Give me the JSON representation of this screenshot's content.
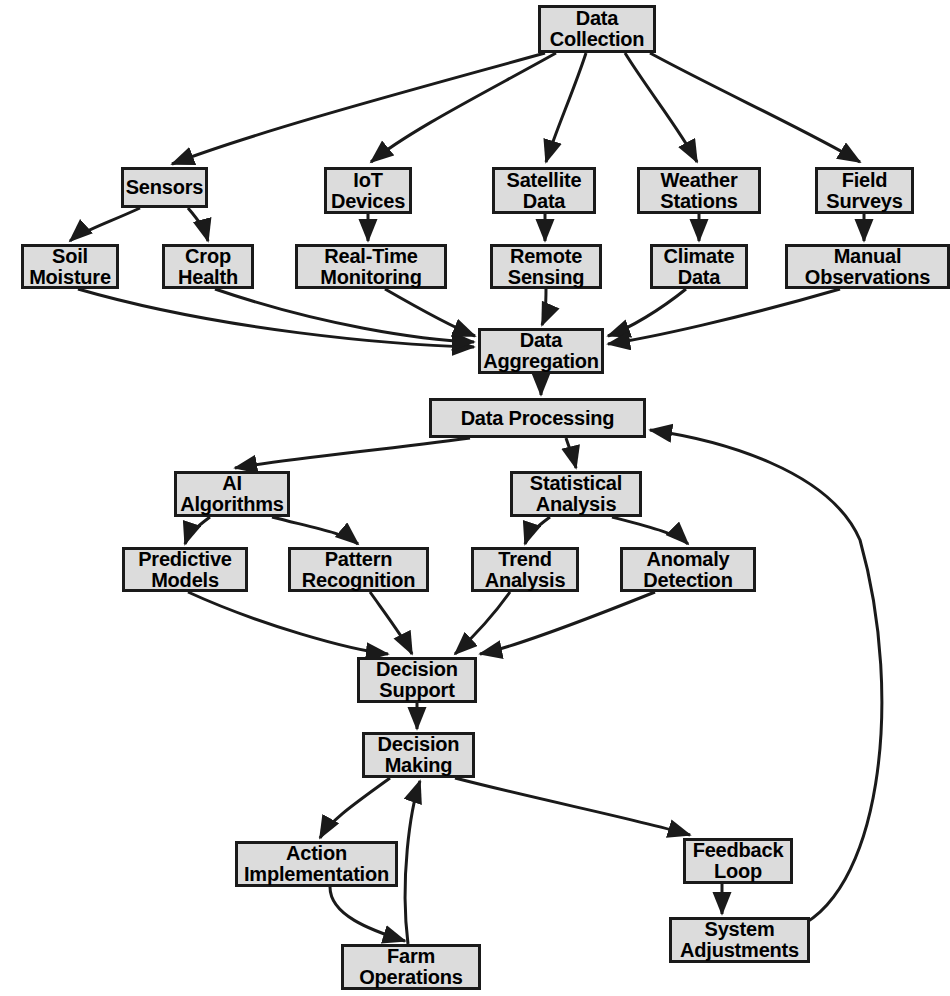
{
  "diagram": {
    "type": "flowchart",
    "background_color": "#ffffff",
    "node_fill_color": "#dcdcdc",
    "node_border_color": "#1a1a1a",
    "edge_color": "#1a1a1a",
    "text_color": "#000000",
    "nodes": [
      {
        "id": "data_collection",
        "label": "Data\nCollection",
        "x": 538,
        "y": 5,
        "w": 118,
        "h": 48
      },
      {
        "id": "sensors",
        "label": "Sensors",
        "x": 121,
        "y": 167,
        "w": 87,
        "h": 41
      },
      {
        "id": "iot_devices",
        "label": "IoT\nDevices",
        "x": 324,
        "y": 167,
        "w": 88,
        "h": 47
      },
      {
        "id": "satellite_data",
        "label": "Satellite\nData",
        "x": 492,
        "y": 167,
        "w": 104,
        "h": 47
      },
      {
        "id": "weather_stations",
        "label": "Weather\nStations",
        "x": 637,
        "y": 167,
        "w": 124,
        "h": 47
      },
      {
        "id": "field_surveys",
        "label": "Field\nSurveys",
        "x": 815,
        "y": 167,
        "w": 99,
        "h": 47
      },
      {
        "id": "soil_moisture",
        "label": "Soil\nMoisture",
        "x": 21,
        "y": 244,
        "w": 98,
        "h": 45
      },
      {
        "id": "crop_health",
        "label": "Crop\nHealth",
        "x": 162,
        "y": 244,
        "w": 92,
        "h": 45
      },
      {
        "id": "real_time_monitoring",
        "label": "Real-Time\nMonitoring",
        "x": 295,
        "y": 244,
        "w": 152,
        "h": 45
      },
      {
        "id": "remote_sensing",
        "label": "Remote\nSensing",
        "x": 490,
        "y": 244,
        "w": 112,
        "h": 45
      },
      {
        "id": "climate_data",
        "label": "Climate\nData",
        "x": 650,
        "y": 244,
        "w": 98,
        "h": 45
      },
      {
        "id": "manual_observations",
        "label": "Manual\nObservations",
        "x": 785,
        "y": 244,
        "w": 165,
        "h": 45
      },
      {
        "id": "data_aggregation",
        "label": "Data\nAggregation",
        "x": 478,
        "y": 328,
        "w": 126,
        "h": 46
      },
      {
        "id": "data_processing",
        "label": "Data Processing",
        "x": 429,
        "y": 398,
        "w": 217,
        "h": 40
      },
      {
        "id": "ai_algorithms",
        "label": "AI\nAlgorithms",
        "x": 174,
        "y": 471,
        "w": 116,
        "h": 46
      },
      {
        "id": "statistical_analysis",
        "label": "Statistical\nAnalysis",
        "x": 510,
        "y": 471,
        "w": 132,
        "h": 46
      },
      {
        "id": "predictive_models",
        "label": "Predictive\nModels",
        "x": 122,
        "y": 547,
        "w": 126,
        "h": 45
      },
      {
        "id": "pattern_recognition",
        "label": "Pattern\nRecognition",
        "x": 288,
        "y": 547,
        "w": 141,
        "h": 45
      },
      {
        "id": "trend_analysis",
        "label": "Trend\nAnalysis",
        "x": 471,
        "y": 547,
        "w": 108,
        "h": 45
      },
      {
        "id": "anomaly_detection",
        "label": "Anomaly\nDetection",
        "x": 620,
        "y": 547,
        "w": 136,
        "h": 45
      },
      {
        "id": "decision_support",
        "label": "Decision\nSupport",
        "x": 357,
        "y": 657,
        "w": 120,
        "h": 46
      },
      {
        "id": "decision_making",
        "label": "Decision\nMaking",
        "x": 362,
        "y": 732,
        "w": 113,
        "h": 46
      },
      {
        "id": "action_implementation",
        "label": "Action\nImplementation",
        "x": 235,
        "y": 841,
        "w": 163,
        "h": 46
      },
      {
        "id": "farm_operations",
        "label": "Farm\nOperations",
        "x": 341,
        "y": 944,
        "w": 140,
        "h": 46
      },
      {
        "id": "feedback_loop",
        "label": "Feedback\nLoop",
        "x": 683,
        "y": 838,
        "w": 110,
        "h": 46
      },
      {
        "id": "system_adjustments",
        "label": "System\nAdjustments",
        "x": 669,
        "y": 917,
        "w": 141,
        "h": 46
      }
    ],
    "edges": [
      {
        "from": "data_collection",
        "to": "sensors"
      },
      {
        "from": "data_collection",
        "to": "iot_devices"
      },
      {
        "from": "data_collection",
        "to": "satellite_data"
      },
      {
        "from": "data_collection",
        "to": "weather_stations"
      },
      {
        "from": "data_collection",
        "to": "field_surveys"
      },
      {
        "from": "sensors",
        "to": "soil_moisture"
      },
      {
        "from": "sensors",
        "to": "crop_health"
      },
      {
        "from": "iot_devices",
        "to": "real_time_monitoring"
      },
      {
        "from": "satellite_data",
        "to": "remote_sensing"
      },
      {
        "from": "weather_stations",
        "to": "climate_data"
      },
      {
        "from": "field_surveys",
        "to": "manual_observations"
      },
      {
        "from": "soil_moisture",
        "to": "data_aggregation"
      },
      {
        "from": "crop_health",
        "to": "data_aggregation"
      },
      {
        "from": "real_time_monitoring",
        "to": "data_aggregation"
      },
      {
        "from": "remote_sensing",
        "to": "data_aggregation"
      },
      {
        "from": "climate_data",
        "to": "data_aggregation"
      },
      {
        "from": "manual_observations",
        "to": "data_aggregation"
      },
      {
        "from": "data_aggregation",
        "to": "data_processing"
      },
      {
        "from": "data_processing",
        "to": "ai_algorithms"
      },
      {
        "from": "data_processing",
        "to": "statistical_analysis"
      },
      {
        "from": "ai_algorithms",
        "to": "predictive_models"
      },
      {
        "from": "ai_algorithms",
        "to": "pattern_recognition"
      },
      {
        "from": "statistical_analysis",
        "to": "trend_analysis"
      },
      {
        "from": "statistical_analysis",
        "to": "anomaly_detection"
      },
      {
        "from": "predictive_models",
        "to": "decision_support"
      },
      {
        "from": "pattern_recognition",
        "to": "decision_support"
      },
      {
        "from": "trend_analysis",
        "to": "decision_support"
      },
      {
        "from": "anomaly_detection",
        "to": "decision_support"
      },
      {
        "from": "decision_support",
        "to": "decision_making"
      },
      {
        "from": "decision_making",
        "to": "action_implementation"
      },
      {
        "from": "action_implementation",
        "to": "farm_operations"
      },
      {
        "from": "decision_making",
        "to": "feedback_loop"
      },
      {
        "from": "feedback_loop",
        "to": "system_adjustments"
      },
      {
        "from": "system_adjustments",
        "to": "data_processing"
      },
      {
        "from": "farm_operations",
        "to": "decision_making"
      }
    ],
    "edge_paths": [
      {
        "id": "e-dc-sensors",
        "d": "M 545,53 C 430,85 260,130 172,164"
      },
      {
        "id": "e-dc-iot",
        "d": "M 556,53 C 490,90 410,130 371,162"
      },
      {
        "id": "e-dc-sat",
        "d": "M 586,53 C 574,90 556,130 546,162"
      },
      {
        "id": "e-dc-weather",
        "d": "M 625,53 C 648,90 680,130 697,162"
      },
      {
        "id": "e-dc-field",
        "d": "M 650,53 C 718,90 810,132 860,162"
      },
      {
        "id": "e-sen-soil",
        "d": "M 140,208 C 110,222 80,232 70,241"
      },
      {
        "id": "e-sen-crop",
        "d": "M 188,208 C 200,222 205,230 208,241"
      },
      {
        "id": "e-iot-rtm",
        "d": "M 368,214 L 368,241"
      },
      {
        "id": "e-sat-rs",
        "d": "M 545,214 L 545,241"
      },
      {
        "id": "e-ws-cd",
        "d": "M 699,214 L 699,241"
      },
      {
        "id": "e-fs-mo",
        "d": "M 864,214 L 864,241"
      },
      {
        "id": "e-soil-da",
        "d": "M 78,289 C 220,330 390,345 474,347"
      },
      {
        "id": "e-crop-da",
        "d": "M 215,289 C 320,325 420,340 474,342"
      },
      {
        "id": "e-rtm-da",
        "d": "M 385,289 C 430,315 460,330 475,336"
      },
      {
        "id": "e-rs-da",
        "d": "M 546,289 C 546,305 545,318 542,325"
      },
      {
        "id": "e-cd-da",
        "d": "M 686,289 C 660,310 630,328 608,336"
      },
      {
        "id": "e-mo-da",
        "d": "M 840,289 C 740,318 650,338 608,344"
      },
      {
        "id": "e-da-dp",
        "d": "M 541,374 L 541,395"
      },
      {
        "id": "e-dp-ai",
        "d": "M 470,438 C 380,450 280,460 235,468"
      },
      {
        "id": "e-dp-sa",
        "d": "M 566,438 C 570,450 574,460 576,468"
      },
      {
        "id": "e-ai-pm",
        "d": "M 210,517 C 195,528 188,535 185,544"
      },
      {
        "id": "e-ai-pr",
        "d": "M 272,517 C 310,527 345,533 358,544"
      },
      {
        "id": "e-sa-ta",
        "d": "M 550,517 C 535,528 528,535 525,544"
      },
      {
        "id": "e-sa-ad",
        "d": "M 612,517 C 650,527 678,534 688,544"
      },
      {
        "id": "e-pm-ds",
        "d": "M 188,592 C 260,625 350,650 388,654"
      },
      {
        "id": "e-pr-ds",
        "d": "M 370,592 C 390,620 405,640 412,654"
      },
      {
        "id": "e-ta-ds",
        "d": "M 510,592 C 490,620 470,640 455,654"
      },
      {
        "id": "e-ad-ds",
        "d": "M 655,592 C 580,622 510,648 480,654"
      },
      {
        "id": "e-ds-dm",
        "d": "M 417,703 L 417,729"
      },
      {
        "id": "e-dm-ai2",
        "d": "M 390,778 C 360,800 330,820 320,838"
      },
      {
        "id": "e-ai2-fo",
        "d": "M 330,887 C 330,915 370,930 405,941"
      },
      {
        "id": "e-dm-fl",
        "d": "M 455,778 C 540,800 640,820 690,835"
      },
      {
        "id": "e-fl-sa2",
        "d": "M 722,884 L 722,914"
      },
      {
        "id": "e-sa2-dp",
        "d": "M 790,930 C 880,900 905,700 860,540 C 830,470 720,440 650,430"
      },
      {
        "id": "e-fo-dm",
        "d": "M 408,944 C 400,880 410,810 420,781"
      }
    ]
  }
}
